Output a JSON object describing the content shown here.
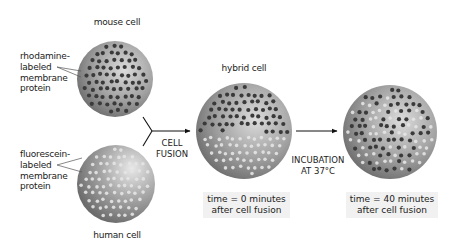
{
  "labels": {
    "mouse_cell": "mouse cell",
    "human_cell": "human cell",
    "hybrid_cell": "hybrid cell",
    "rhodamine": [
      "rhodamine-",
      "labeled",
      "membrane",
      "protein"
    ],
    "fluorescein": [
      "fluorescein-",
      "labeled",
      "membrane",
      "protein"
    ],
    "cell_fusion": [
      "CELL",
      "FUSION"
    ],
    "incubation": [
      "INCUBATION",
      "AT 37°C"
    ],
    "caption_t0": [
      "time = 0 minutes",
      "after cell fusion"
    ],
    "caption_t40": [
      "time = 40 minutes",
      "after cell fusion"
    ]
  },
  "colors": {
    "cell_light": "#d6d6d6",
    "cell_mid": "#9a9a9a",
    "cell_dark": "#6e6e6e",
    "rhodamine_dot": "#3a3a3a",
    "fluorescein_dot": "#e4e4e4",
    "arrow": "#111111",
    "caption_bg": "#f1f1f1"
  },
  "cells": [
    {
      "id": "mouse",
      "cx": 115,
      "cy": 79,
      "r": 38,
      "dots": "dark"
    },
    {
      "id": "human",
      "cx": 116,
      "cy": 184,
      "r": 39,
      "dots": "light"
    },
    {
      "id": "hybrid",
      "cx": 244,
      "cy": 131,
      "r": 48,
      "dots": "split"
    },
    {
      "id": "mixed",
      "cx": 390,
      "cy": 132,
      "r": 47,
      "dots": "mixed"
    }
  ]
}
